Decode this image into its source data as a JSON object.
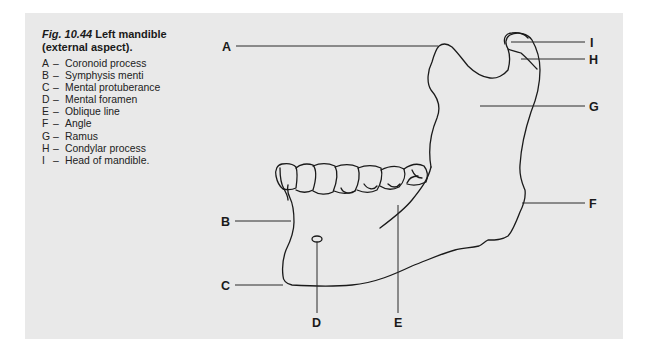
{
  "caption": {
    "figure_number": "Fig. 10.44",
    "title": "Left mandible",
    "subtitle": "(external aspect)."
  },
  "legend": [
    {
      "key": "A",
      "dash": "–",
      "text": "Coronoid process"
    },
    {
      "key": "B",
      "dash": "–",
      "text": "Symphysis menti"
    },
    {
      "key": "C",
      "dash": "–",
      "text": "Mental protuberance"
    },
    {
      "key": "D",
      "dash": "–",
      "text": "Mental foramen"
    },
    {
      "key": "E",
      "dash": "–",
      "text": "Oblique line"
    },
    {
      "key": "F",
      "dash": "–",
      "text": "Angle"
    },
    {
      "key": "G",
      "dash": "–",
      "text": "Ramus"
    },
    {
      "key": "H",
      "dash": "–",
      "text": "Condylar process"
    },
    {
      "key": "I",
      "dash": "–",
      "text": "Head of mandible."
    }
  ],
  "labels": {
    "A": "A",
    "B": "B",
    "C": "C",
    "D": "D",
    "E": "E",
    "F": "F",
    "G": "G",
    "H": "H",
    "I": "I"
  },
  "colors": {
    "panel": "#e9e9e9",
    "ink": "#1a1a1a"
  }
}
